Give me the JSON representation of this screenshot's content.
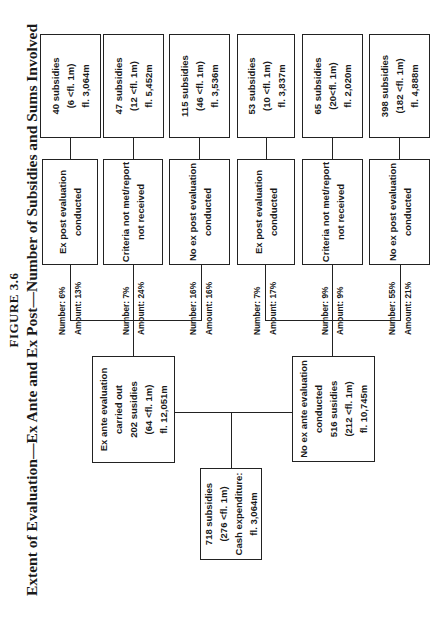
{
  "figure": {
    "number": "FIGURE 3.6",
    "title": "Extent of Evaluation—Ex Ante and Ex Post—Number of Subsidies and Sums Involved"
  },
  "root": {
    "lines": [
      "718 subsidies",
      "(276 <fl. 1m)",
      "Cash expenditure:",
      "fl. 3,064m"
    ]
  },
  "ex_ante": {
    "edge": {
      "number": "Number: 28%",
      "amount": "Amount: 53%"
    },
    "lines": [
      "Ex ante evaluation",
      "carried out",
      "202 susidies",
      "(64 <fl. 1m)",
      "fl. 12,051m"
    ],
    "children": [
      {
        "edge": {
          "number": "Number: 6%",
          "amount": "Amount: 13%"
        },
        "lines": [
          "Ex post evaluation",
          "conducted"
        ],
        "leaf": [
          "40 subsidies",
          "(6 <fl. 1m)",
          "fl. 3,064m"
        ]
      },
      {
        "edge": {
          "number": "Number: 7%",
          "amount": "Amount: 24%"
        },
        "lines": [
          "Criteria not met/report",
          "not received"
        ],
        "leaf": [
          "47 subsidies",
          "(12 <fl. 1m)",
          "fl. 5,452m"
        ]
      },
      {
        "edge": {
          "number": "Number: 16%",
          "amount": "Amount: 16%"
        },
        "lines": [
          "No ex post evaluation",
          "conducted"
        ],
        "leaf": [
          "115 subsidies",
          "(46 <fl. 1m)",
          "fl. 3,536m"
        ]
      }
    ]
  },
  "no_ex_ante": {
    "edge": {
      "number": "Number: 72%",
      "amount": "Amount: 47%"
    },
    "lines": [
      "No ex ante evaluation",
      "conducted",
      "516 susidies",
      "(212 <fl. 1m)",
      "fl. 10,745m"
    ],
    "children": [
      {
        "edge": {
          "number": "Number: 7%",
          "amount": "Amount: 17%"
        },
        "lines": [
          "Ex post evaluation",
          "conducted"
        ],
        "leaf": [
          "53 subsidies",
          "(10 <fl. 1m)",
          "fl. 3,837m"
        ]
      },
      {
        "edge": {
          "number": "Number: 9%",
          "amount": "Amount: 9%"
        },
        "lines": [
          "Criteria not met/report",
          "not received"
        ],
        "leaf": [
          "65 subsidies",
          "(20<fl. 1m)",
          "fl. 2,020m"
        ]
      },
      {
        "edge": {
          "number": "Number: 55%",
          "amount": "Amount: 21%"
        },
        "lines": [
          "No ex post evaluation",
          "conducted"
        ],
        "leaf": [
          "398 subsidies",
          "(182 <fl. 1m)",
          "fl. 4,888m"
        ]
      }
    ]
  }
}
